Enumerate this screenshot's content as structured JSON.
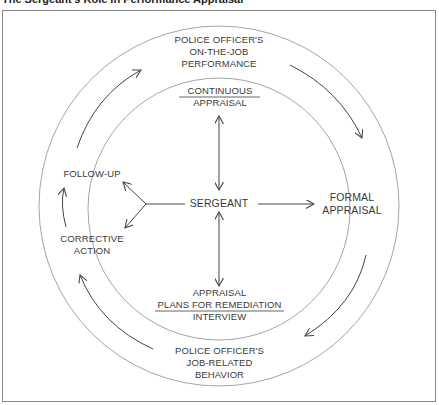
{
  "title": "The Sergeant's Role in Performance Appraisal",
  "diagram": {
    "center": "SERGEANT",
    "outer_top": [
      "POLICE OFFICER'S",
      "ON-THE-JOB",
      "PERFORMANCE"
    ],
    "outer_bottom": [
      "POLICE OFFICER'S",
      "JOB-RELATED",
      "BEHAVIOR"
    ],
    "inner_top": [
      "CONTINUOUS",
      "APPRAISAL"
    ],
    "inner_bottom": [
      "APPRAISAL",
      "PLANS FOR REMEDIATION",
      "INTERVIEW"
    ],
    "right": [
      "FORMAL",
      "APPRAISAL"
    ],
    "left_top": "FOLLOW-UP",
    "left_bottom": [
      "CORRECTIVE",
      "ACTION"
    ]
  },
  "colors": {
    "line": "#444444",
    "circle": "#9a9a9a",
    "text": "#3a3a3a",
    "frame": "#8a8a8a"
  }
}
